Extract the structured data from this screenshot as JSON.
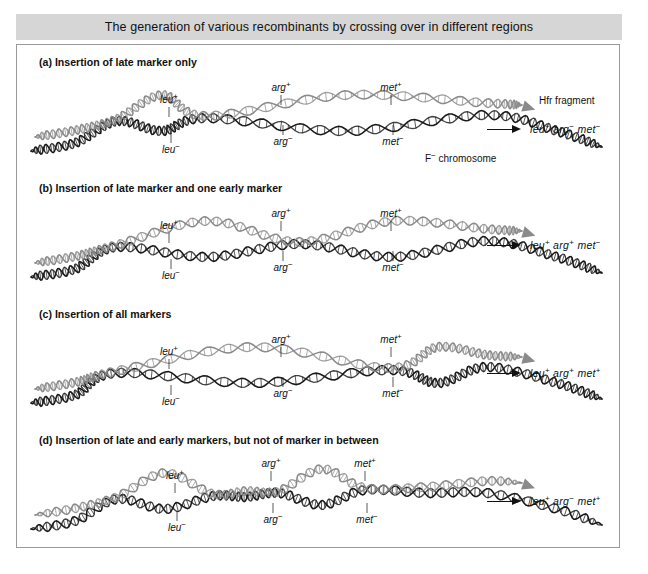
{
  "figure": {
    "title": "The generation of various recombinants by crossing over in different regions",
    "colors": {
      "hfr_strand": "#8a8a8a",
      "f_strand": "#1a1a1a",
      "title_band": "#d6d6d6",
      "frame_border": "#9a9a9a",
      "text": "#111111"
    },
    "annotations": {
      "hfr_fragment": "Hfr fragment",
      "f_chromosome_prefix": "F",
      "f_chromosome_sup": "−",
      "f_chromosome_suffix": " chromosome"
    }
  },
  "panels": [
    {
      "id": "a",
      "heading": "(a) Insertion of late marker only",
      "crossovers": 2,
      "loops": 1,
      "markers_upper": [
        {
          "gene": "leu",
          "sign": "+"
        },
        {
          "gene": "arg",
          "sign": "+"
        },
        {
          "gene": "met",
          "sign": "+"
        }
      ],
      "markers_lower": [
        {
          "gene": "leu",
          "sign": "−"
        },
        {
          "gene": "arg",
          "sign": "−"
        },
        {
          "gene": "met",
          "sign": "−"
        }
      ],
      "result": [
        {
          "gene": "leu",
          "sign": "+"
        },
        {
          "gene": "arg",
          "sign": "−"
        },
        {
          "gene": "met",
          "sign": "−"
        }
      ]
    },
    {
      "id": "b",
      "heading": "(b) Insertion of late marker and one early marker",
      "crossovers": 2,
      "loops": 1,
      "markers_upper": [
        {
          "gene": "leu",
          "sign": "+"
        },
        {
          "gene": "arg",
          "sign": "+"
        },
        {
          "gene": "met",
          "sign": "+"
        }
      ],
      "markers_lower": [
        {
          "gene": "leu",
          "sign": "−"
        },
        {
          "gene": "arg",
          "sign": "−"
        },
        {
          "gene": "met",
          "sign": "−"
        }
      ],
      "result": [
        {
          "gene": "leu",
          "sign": "+"
        },
        {
          "gene": "arg",
          "sign": "+"
        },
        {
          "gene": "met",
          "sign": "−"
        }
      ]
    },
    {
      "id": "c",
      "heading": "(c) Insertion of all markers",
      "crossovers": 2,
      "loops": 1,
      "markers_upper": [
        {
          "gene": "leu",
          "sign": "+"
        },
        {
          "gene": "arg",
          "sign": "+"
        },
        {
          "gene": "met",
          "sign": "+"
        }
      ],
      "markers_lower": [
        {
          "gene": "leu",
          "sign": "−"
        },
        {
          "gene": "arg",
          "sign": "−"
        },
        {
          "gene": "met",
          "sign": "−"
        }
      ],
      "result": [
        {
          "gene": "leu",
          "sign": "+"
        },
        {
          "gene": "arg",
          "sign": "+"
        },
        {
          "gene": "met",
          "sign": "+"
        }
      ]
    },
    {
      "id": "d",
      "heading": "(d) Insertion of late and early markers, but not of marker in between",
      "crossovers": 4,
      "loops": 3,
      "markers_upper": [
        {
          "gene": "leu",
          "sign": "+"
        },
        {
          "gene": "arg",
          "sign": "+"
        },
        {
          "gene": "met",
          "sign": "+"
        }
      ],
      "markers_lower": [
        {
          "gene": "leu",
          "sign": "−"
        },
        {
          "gene": "arg",
          "sign": "−"
        },
        {
          "gene": "met",
          "sign": "−"
        }
      ],
      "result": [
        {
          "gene": "leu",
          "sign": "+"
        },
        {
          "gene": "arg",
          "sign": "−"
        },
        {
          "gene": "met",
          "sign": "+"
        }
      ]
    }
  ]
}
